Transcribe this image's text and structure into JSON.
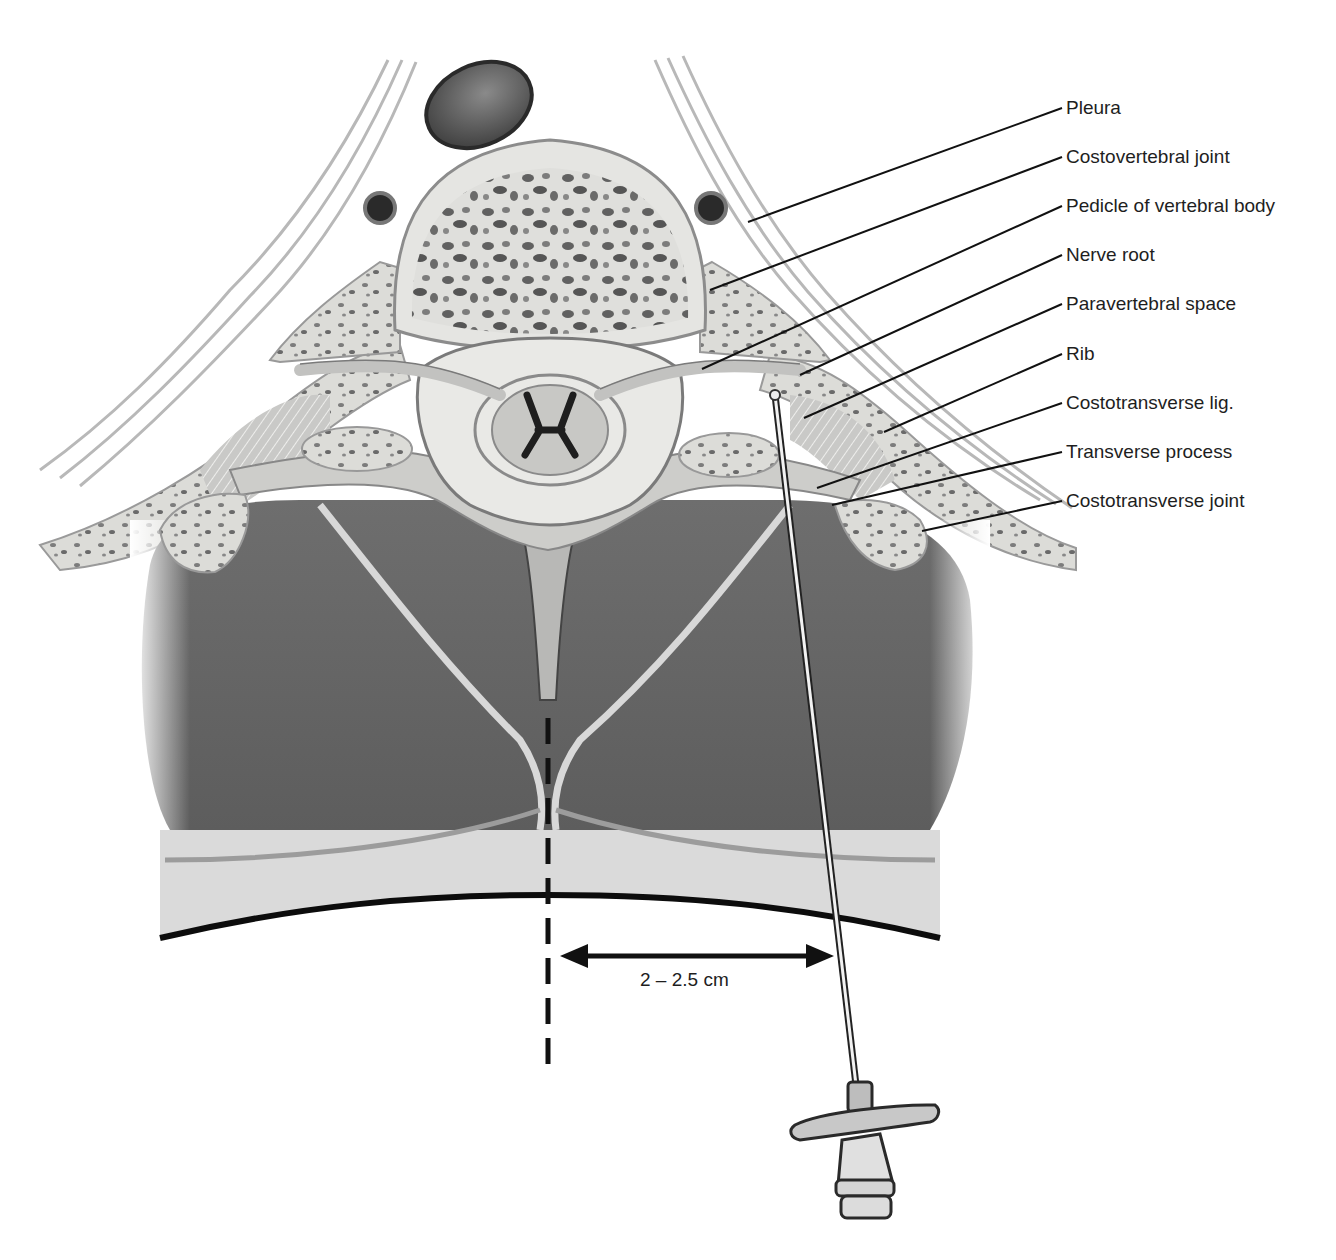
{
  "figure": {
    "labels": [
      {
        "id": "pleura",
        "text": "Pleura",
        "x": 1066,
        "y": 97,
        "target": [
          748,
          222
        ]
      },
      {
        "id": "costovertebral-joint",
        "text": "Costovertebral joint",
        "x": 1066,
        "y": 146,
        "target": [
          710,
          290
        ]
      },
      {
        "id": "pedicle",
        "text": "Pedicle of vertebral body",
        "x": 1066,
        "y": 195,
        "target": [
          702,
          369
        ]
      },
      {
        "id": "nerve-root",
        "text": "Nerve root",
        "x": 1066,
        "y": 244,
        "target": [
          800,
          375
        ]
      },
      {
        "id": "paravertebral-space",
        "text": "Paravertebral space",
        "x": 1066,
        "y": 293,
        "target": [
          804,
          418
        ]
      },
      {
        "id": "rib",
        "text": "Rib",
        "x": 1066,
        "y": 343,
        "target": [
          884,
          432
        ]
      },
      {
        "id": "costotransverse-lig",
        "text": "Costotransverse lig.",
        "x": 1066,
        "y": 392,
        "target": [
          817,
          488
        ]
      },
      {
        "id": "transverse-process",
        "text": "Transverse process",
        "x": 1066,
        "y": 441,
        "target": [
          832,
          505
        ]
      },
      {
        "id": "costotransverse-joint",
        "text": "Costotransverse joint",
        "x": 1066,
        "y": 490,
        "target": [
          922,
          531
        ]
      }
    ],
    "measurement": {
      "text": "2 – 2.5 cm",
      "from_x": 560,
      "to_x": 834,
      "y": 956
    },
    "midline": {
      "x": 548,
      "y_start": 718,
      "y_end": 1068
    },
    "colors": {
      "background": "#ffffff",
      "text": "#1e1e1e",
      "leader_line": "#111111",
      "bone_light": "#e4e4e2",
      "bone_dark": "#cfcfcc",
      "muscle": "#6b6b6b",
      "fat": "#dcdcdc",
      "skin_line": "#0c0c0c",
      "cancellous_spots": "#555555"
    }
  }
}
